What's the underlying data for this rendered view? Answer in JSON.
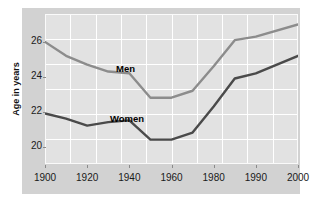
{
  "chart_data": {
    "type": "line",
    "title": "",
    "subtitle": "",
    "xlabel": "",
    "ylabel": "Age in years",
    "xlim": [
      1900,
      2000
    ],
    "ylim": [
      19.0,
      27.6
    ],
    "grid": true,
    "legend_position": "inline-annotation",
    "x_ticks": [
      1900,
      1920,
      1940,
      1960,
      1980,
      1990,
      2000
    ],
    "x_tick_labels": [
      "1900",
      "1920",
      "1940",
      "1960",
      "1980",
      "1990",
      "2000"
    ],
    "y_ticks": [
      20,
      22,
      24,
      26
    ],
    "y_tick_labels": [
      "20",
      "22",
      "24",
      "26"
    ],
    "series": [
      {
        "name": "Men",
        "color": "#8c8c8c",
        "x": [
          1900,
          1910,
          1920,
          1930,
          1940,
          1950,
          1960,
          1970,
          1980,
          1985,
          1990,
          2000
        ],
        "values": [
          26.0,
          25.2,
          24.7,
          24.3,
          24.2,
          22.8,
          22.8,
          23.2,
          24.6,
          26.1,
          26.3,
          27.0
        ]
      },
      {
        "name": "Women",
        "color": "#4a4a4a",
        "x": [
          1900,
          1910,
          1920,
          1930,
          1940,
          1950,
          1960,
          1970,
          1980,
          1985,
          1990,
          2000
        ],
        "values": [
          21.9,
          21.6,
          21.2,
          21.4,
          21.5,
          20.4,
          20.4,
          20.8,
          22.3,
          23.9,
          24.2,
          25.2
        ]
      }
    ],
    "annotations": [
      {
        "text": "Men",
        "x": 1940,
        "y": 25.0
      },
      {
        "text": "Women",
        "x": 1937,
        "y": 22.1
      }
    ],
    "colors": {
      "panel_background": "#d2d2d2",
      "plot_background": "#e2e2e2",
      "gridline": "#ffffff",
      "page_background": "#ffffff",
      "text": "#1a1a1a"
    }
  }
}
